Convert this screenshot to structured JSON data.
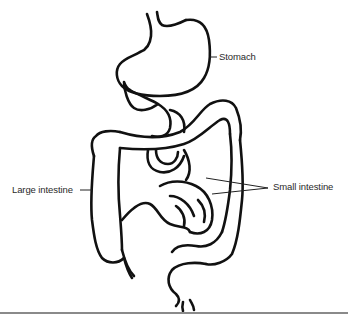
{
  "diagram": {
    "labels": {
      "stomach": "Stomach",
      "large_intestine": "Large intestine",
      "small_intestine": "Small intestine"
    },
    "colors": {
      "line": "#111111",
      "text": "#2a2a2a",
      "rule": "#8a8a8a",
      "background": "#ffffff"
    }
  }
}
